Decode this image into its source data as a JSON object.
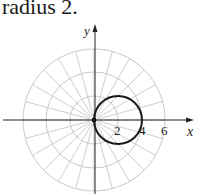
{
  "caption": "radius 2.",
  "diagram": {
    "type": "polar-graph",
    "curve": "r = 4cos(theta)",
    "circle": {
      "center_units": [
        2,
        0
      ],
      "radius_units": 2
    },
    "grid": {
      "ring_radii_units": [
        2,
        4,
        6
      ],
      "ray_step_degrees": 15
    },
    "axes": {
      "x_label": "x",
      "y_label": "y"
    },
    "tick_labels": [
      "2",
      "4",
      "6"
    ],
    "colors": {
      "grid": "#c8c8c8",
      "axis": "#222222",
      "curve": "#1a1a1a"
    }
  }
}
